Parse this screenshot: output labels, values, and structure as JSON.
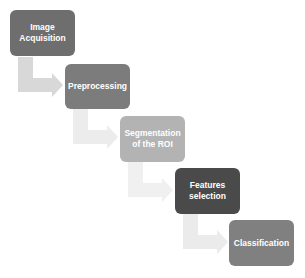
{
  "diagram": {
    "type": "staircase-process-flow",
    "steps": [
      {
        "label": "Image Acquisition",
        "line1": "Image",
        "line2": "Acquisition",
        "color": "#6e6e6e"
      },
      {
        "label": "Preprocessing",
        "line1": "Preprocessing",
        "line2": "",
        "color": "#7c7c7c"
      },
      {
        "label": "Segmentation of the ROI",
        "line1": "Segmentation",
        "line2": "of the ROI",
        "color": "#b3b3b3"
      },
      {
        "label": "Features selection",
        "line1": "Features",
        "line2": "selection",
        "color": "#4a4a4a"
      },
      {
        "label": "Classification",
        "line1": "Classification",
        "line2": "",
        "color": "#808080"
      }
    ],
    "arrows": [
      {
        "from": 0,
        "to": 1,
        "color": "#d6d6d6"
      },
      {
        "from": 1,
        "to": 2,
        "color": "#ececec"
      },
      {
        "from": 2,
        "to": 3,
        "color": "#efefef"
      },
      {
        "from": 3,
        "to": 4,
        "color": "#ebebeb"
      }
    ]
  }
}
